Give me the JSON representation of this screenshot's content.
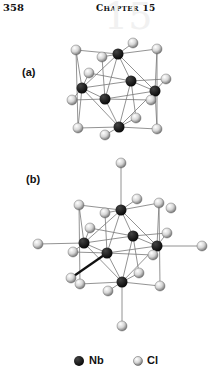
{
  "header": {
    "page_number": "358",
    "chapter_label": "Chapter 15",
    "chapter_first": "C",
    "chapter_rest": "HAPTER",
    "chapter_number": "15",
    "watermark": "15"
  },
  "figure": {
    "panel_a_label": "(a)",
    "panel_b_label": "(b)",
    "colors": {
      "nb": "#111111",
      "cl_fill": "#d8d8d8",
      "cl_stroke": "#666666",
      "bond": "#777777",
      "bond_thick": "#111111"
    }
  },
  "legend": {
    "items": [
      {
        "symbol": "filled-black-sphere",
        "label": "Nb"
      },
      {
        "symbol": "grey-shaded-sphere",
        "label": "Cl"
      }
    ]
  }
}
